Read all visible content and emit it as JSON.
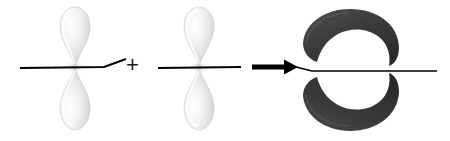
{
  "diagram": {
    "type": "orbital-combination",
    "width": 450,
    "height": 141,
    "background_color": "#ffffff",
    "axis_color": "#000000",
    "operator_plus": "+",
    "operands": [
      {
        "name": "p-orbital-left",
        "kind": "p-orbital",
        "node_x": 75,
        "node_y": 67,
        "lobe_fill_light": "#fcfcfc",
        "lobe_fill_mid": "#e2e2e2",
        "lobe_fill_dark": "#bdbdbd",
        "lobe_top_label": "upper lobe",
        "lobe_bottom_label": "lower lobe",
        "axis_start_x": 20,
        "axis_end_x": 104,
        "axis_kink_x": 126,
        "axis_kink_y": 59
      },
      {
        "name": "p-orbital-right",
        "kind": "p-orbital",
        "node_x": 199,
        "node_y": 67,
        "lobe_fill_light": "#fcfcfc",
        "lobe_fill_mid": "#e2e2e2",
        "lobe_fill_dark": "#bdbdbd",
        "lobe_top_label": "upper lobe",
        "lobe_bottom_label": "lower lobe",
        "axis_start_x": 158,
        "axis_end_x": 241
      }
    ],
    "arrow": {
      "name": "reaction-arrow",
      "direction": "right",
      "start_x": 252,
      "end_x": 297,
      "y": 67,
      "color": "#000000"
    },
    "product": {
      "name": "pi-antibonding-orbital",
      "kind": "crescent-pair",
      "fill_light": "#4a4a4a",
      "fill_mid": "#3a3a3a",
      "fill_dark": "#2a2a2a",
      "upper_label": "upper crescent lobe",
      "lower_label": "lower crescent lobe",
      "axis_start_x": 300,
      "axis_end_x": 437,
      "axis_y": 70,
      "nodal_gap_y": 70
    }
  }
}
